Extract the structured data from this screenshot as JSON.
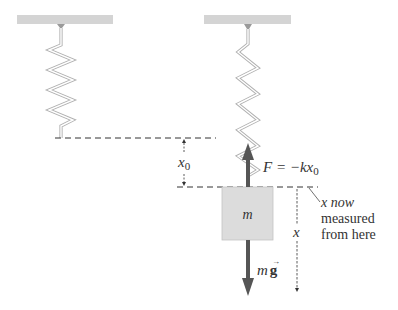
{
  "diagram": {
    "type": "spring-mass system, vertical",
    "colors": {
      "ceiling": "#d4d4d4",
      "spring": "#b8b8b8",
      "mass_fill": "#dcdcdc",
      "force_arrow": "#555555",
      "dashed_line": "#333333",
      "text": "#333333"
    },
    "left_panel": {
      "description": "unstretched spring hanging from ceiling"
    },
    "right_panel": {
      "description": "spring stretched by mass m in equilibrium"
    },
    "labels": {
      "x0": "x",
      "x0_sub": "0",
      "spring_force": "F = −kx",
      "spring_force_sub": "0",
      "mass": "m",
      "gravity_m": "m",
      "gravity_g": "g",
      "x_axis": "x",
      "note_line1": "x now",
      "note_line2": "measured",
      "note_line3": "from here"
    }
  }
}
